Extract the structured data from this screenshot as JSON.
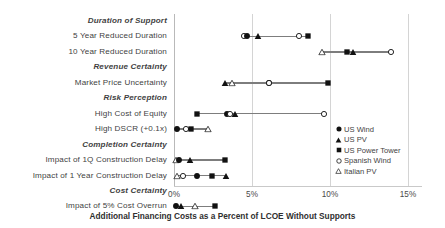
{
  "chart_data": {
    "type": "scatter",
    "title": "",
    "xlabel": "Additional Financing Costs as a Percent of LCOE Without Supports",
    "ylabel": "",
    "xlim": [
      0,
      15.8
    ],
    "xticks": [
      "0%",
      "5%",
      "10%",
      "15%"
    ],
    "xtickvalues": [
      0,
      5,
      10,
      15
    ],
    "grid": true,
    "legend_position": "right",
    "legend": [
      {
        "name": "US Wind",
        "marker": "filled-circle"
      },
      {
        "name": "US PV",
        "marker": "filled-triangle"
      },
      {
        "name": "US Power Tower",
        "marker": "filled-square"
      },
      {
        "name": "Spanish Wind",
        "marker": "open-circle"
      },
      {
        "name": "Italian PV",
        "marker": "open-triangle"
      }
    ],
    "rows": [
      {
        "label": "Duration of Support",
        "type": "group",
        "points": []
      },
      {
        "label": "5 Year Reduced Duration",
        "type": "data",
        "points": [
          {
            "series": "Spanish Wind",
            "marker": "open-circle",
            "value": 4.5
          },
          {
            "series": "US Wind",
            "marker": "filled-circle",
            "value": 4.7
          },
          {
            "series": "US PV",
            "marker": "filled-triangle",
            "value": 5.4
          },
          {
            "series": "Spanish Wind",
            "marker": "open-circle",
            "value": 8.0
          },
          {
            "series": "US Power Tower",
            "marker": "filled-square",
            "value": 8.6
          }
        ]
      },
      {
        "label": "10 Year Reduced Duration",
        "type": "data",
        "points": [
          {
            "series": "Italian PV",
            "marker": "open-triangle",
            "value": 9.5
          },
          {
            "series": "US Power Tower",
            "marker": "filled-square",
            "value": 11.1
          },
          {
            "series": "US PV",
            "marker": "filled-triangle",
            "value": 11.5
          },
          {
            "series": "Spanish Wind",
            "marker": "open-circle",
            "value": 13.9
          }
        ]
      },
      {
        "label": "Revenue Certainty",
        "type": "group",
        "points": []
      },
      {
        "label": "Market Price Uncertainty",
        "type": "data",
        "points": [
          {
            "series": "US PV",
            "marker": "filled-triangle",
            "value": 3.3
          },
          {
            "series": "Italian PV",
            "marker": "open-triangle",
            "value": 3.7
          },
          {
            "series": "US Wind",
            "marker": "filled-circle",
            "value": 6.1
          },
          {
            "series": "Spanish Wind",
            "marker": "open-circle",
            "value": 6.1
          },
          {
            "series": "US Power Tower",
            "marker": "filled-square",
            "value": 9.9
          }
        ]
      },
      {
        "label": "Risk Perception",
        "type": "group",
        "points": []
      },
      {
        "label": "High Cost of Equity",
        "type": "data",
        "points": [
          {
            "series": "US Power Tower",
            "marker": "filled-square",
            "value": 1.5
          },
          {
            "series": "US Wind",
            "marker": "filled-circle",
            "value": 3.4
          },
          {
            "series": "Spanish Wind",
            "marker": "open-circle",
            "value": 3.6
          },
          {
            "series": "US PV",
            "marker": "filled-triangle",
            "value": 3.9
          },
          {
            "series": "Spanish Wind",
            "marker": "open-circle",
            "value": 9.6
          }
        ]
      },
      {
        "label": "High DSCR (+0.1x)",
        "type": "data",
        "points": [
          {
            "series": "US Wind",
            "marker": "filled-circle",
            "value": 0.2
          },
          {
            "series": "Spanish Wind",
            "marker": "open-circle",
            "value": 0.8
          },
          {
            "series": "US Power Tower",
            "marker": "filled-square",
            "value": 1.1
          },
          {
            "series": "Italian PV",
            "marker": "open-triangle",
            "value": 2.2
          }
        ]
      },
      {
        "label": "Completion Certainty",
        "type": "group",
        "points": []
      },
      {
        "label": "Impact of 1Q Construction  Delay",
        "type": "data",
        "points": [
          {
            "series": "Italian PV",
            "marker": "open-triangle",
            "value": 0.1
          },
          {
            "series": "US Wind",
            "marker": "filled-circle",
            "value": 0.35
          },
          {
            "series": "US PV",
            "marker": "filled-triangle",
            "value": 1.0
          },
          {
            "series": "US Power Tower",
            "marker": "filled-square",
            "value": 3.3
          }
        ]
      },
      {
        "label": "Impact of 1 Year  Construction Delay",
        "type": "data",
        "points": [
          {
            "series": "Italian PV",
            "marker": "open-triangle",
            "value": 0.2
          },
          {
            "series": "Spanish Wind",
            "marker": "open-circle",
            "value": 0.55
          },
          {
            "series": "US Wind",
            "marker": "filled-circle",
            "value": 1.45
          },
          {
            "series": "US Power Tower",
            "marker": "filled-square",
            "value": 2.45
          },
          {
            "series": "US PV",
            "marker": "filled-triangle",
            "value": 3.35
          }
        ]
      },
      {
        "label": "Cost Certainty",
        "type": "group",
        "points": []
      },
      {
        "label": "Impact of 5% Cost Overrun",
        "type": "data",
        "points": [
          {
            "series": "US Wind",
            "marker": "filled-circle",
            "value": 0.1
          },
          {
            "series": "US PV",
            "marker": "filled-triangle",
            "value": 0.45
          },
          {
            "series": "Italian PV",
            "marker": "open-triangle",
            "value": 1.35
          },
          {
            "series": "US Power Tower",
            "marker": "filled-square",
            "value": 2.6
          }
        ]
      }
    ],
    "colors": {
      "marker": "#111111",
      "connector": "#7d7d7d",
      "grid": "#d4d4d4",
      "text": "#3f3f3f"
    }
  }
}
